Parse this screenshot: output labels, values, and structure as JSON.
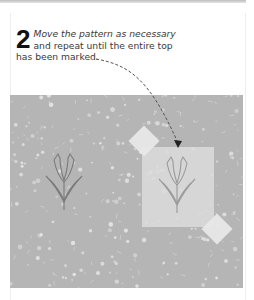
{
  "step": {
    "number": "2",
    "line1": "Move the pattern as necessary",
    "line2": "and repeat until the entire top",
    "line3": "has been marked."
  },
  "illustration": {
    "fabric_color": "#b5b5b5",
    "pattern_sheet_color": "#dcdcdc",
    "tape_color": "#e8e8e8",
    "outline_color": "#7a7a7a",
    "arrow_color": "#555555",
    "motifs": [
      "tulip-outline-marked",
      "tulip-outline-under-pattern"
    ],
    "arrow_style": "dashed"
  }
}
